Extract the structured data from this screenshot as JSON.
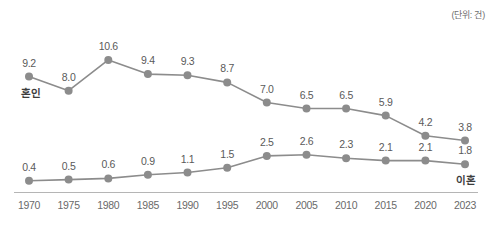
{
  "unit_note": "(단위: 건)",
  "colors": {
    "line": "#8c8c8c",
    "marker": "#8c8c8c",
    "label_text": "#5a5a5a",
    "tick_text": "#6a6a6a",
    "axis": "#b5b5b5",
    "background": "#ffffff"
  },
  "chart_data": {
    "type": "line",
    "title": "",
    "subtitle": "",
    "xlabel": "",
    "ylabel": "",
    "annotations": [
      "(단위: 건)"
    ],
    "legend_position": "inline-endpoint",
    "grid": false,
    "ylim": [
      0,
      11.5
    ],
    "categories": [
      "1970",
      "1975",
      "1980",
      "1985",
      "1990",
      "1995",
      "2000",
      "2005",
      "2010",
      "2015",
      "2020",
      "2023"
    ],
    "series": [
      {
        "name": "혼인",
        "label_anchor": "start",
        "values": [
          9.2,
          8.0,
          10.6,
          9.4,
          9.3,
          8.7,
          7.0,
          6.5,
          6.5,
          5.9,
          4.2,
          3.8
        ],
        "value_labels": [
          "9.2",
          "8.0",
          "10.6",
          "9.4",
          "9.3",
          "8.7",
          "7.0",
          "6.5",
          "6.5",
          "5.9",
          "4.2",
          "3.8"
        ]
      },
      {
        "name": "이혼",
        "label_anchor": "end",
        "values": [
          0.4,
          0.5,
          0.6,
          0.9,
          1.1,
          1.5,
          2.5,
          2.6,
          2.3,
          2.1,
          2.1,
          1.8
        ],
        "value_labels": [
          "0.4",
          "0.5",
          "0.6",
          "0.9",
          "1.1",
          "1.5",
          "2.5",
          "2.6",
          "2.3",
          "2.1",
          "2.1",
          "1.8"
        ]
      }
    ]
  }
}
